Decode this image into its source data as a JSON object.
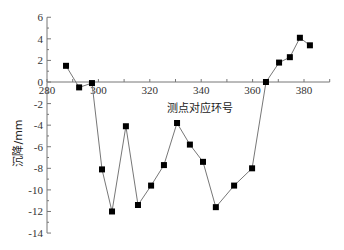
{
  "chart_data": {
    "type": "line",
    "title": "",
    "xlabel": "测点对应环号",
    "ylabel": "沉降/mm",
    "xlim": [
      280,
      390
    ],
    "ylim": [
      -14,
      6
    ],
    "xticks": [
      280,
      300,
      320,
      340,
      360,
      380
    ],
    "yticks": [
      6,
      4,
      2,
      0,
      -2,
      -4,
      -6,
      -8,
      -10,
      -12,
      -14
    ],
    "grid": false,
    "legend": null,
    "marker": "square",
    "line_color": "#777777",
    "marker_color": "#000000",
    "series": [
      {
        "name": "沉降",
        "x": [
          287.4,
          292.5,
          297.5,
          301.4,
          305.3,
          310.7,
          315.4,
          320.5,
          325.5,
          330.6,
          335.6,
          340.7,
          345.7,
          352.8,
          359.8,
          365.2,
          370.3,
          374.5,
          378.4,
          382.3
        ],
        "y": [
          1.5,
          -0.5,
          -0.1,
          -8.1,
          -12.0,
          -4.1,
          -11.4,
          -9.6,
          -7.7,
          -3.8,
          -5.8,
          -7.4,
          -11.6,
          -9.6,
          -8.0,
          0.0,
          1.8,
          2.3,
          4.1,
          3.4
        ]
      }
    ]
  }
}
